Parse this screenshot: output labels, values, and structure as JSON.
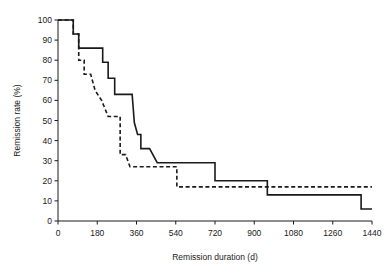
{
  "chart_data": {
    "type": "line",
    "title": "",
    "xlabel": "Remission duration (d)",
    "ylabel": "Remission rate (%)",
    "xlim": [
      0,
      1440
    ],
    "ylim": [
      0,
      100
    ],
    "xticks": [
      0,
      180,
      360,
      540,
      720,
      900,
      1080,
      1260,
      1440
    ],
    "yticks": [
      0,
      10,
      20,
      30,
      40,
      50,
      60,
      70,
      80,
      90,
      100
    ],
    "xtick_labels": [
      "0",
      "180",
      "360",
      "540",
      "720",
      "900",
      "1080",
      "1260",
      "1440"
    ],
    "ytick_labels": [
      "0",
      "10",
      "20",
      "30",
      "40",
      "50",
      "60",
      "70",
      "80",
      "90",
      "100"
    ],
    "grid": false,
    "legend": "none",
    "step_style": "post",
    "series": [
      {
        "name": "solid-curve",
        "style": "solid",
        "color": "#1a1a1a",
        "x": [
          0,
          70,
          70,
          95,
          95,
          120,
          205,
          205,
          230,
          230,
          260,
          260,
          340,
          340,
          350,
          350,
          365,
          365,
          380,
          380,
          420,
          420,
          455,
          455,
          540,
          540,
          720,
          720,
          960,
          960,
          1390,
          1390,
          1440
        ],
        "y": [
          100,
          100,
          93,
          93,
          86,
          86,
          86,
          79,
          79,
          71,
          71,
          63,
          63,
          63,
          49,
          49,
          43,
          43,
          43,
          36,
          36,
          36,
          29,
          29,
          29,
          29,
          29,
          20,
          20,
          13,
          13,
          6,
          6
        ]
      },
      {
        "name": "dashed-curve",
        "style": "dashed",
        "color": "#1a1a1a",
        "x": [
          0,
          70,
          70,
          95,
          95,
          120,
          120,
          150,
          150,
          170,
          170,
          200,
          200,
          230,
          230,
          285,
          285,
          310,
          310,
          330,
          330,
          545,
          545,
          960,
          960,
          1440
        ],
        "y": [
          100,
          100,
          93,
          93,
          80,
          80,
          73,
          73,
          73,
          65,
          65,
          60,
          60,
          52,
          52,
          52,
          33,
          33,
          33,
          27,
          27,
          27,
          17,
          17,
          17,
          17
        ]
      }
    ]
  },
  "figure": {
    "xaxis_title": "Remission duration (d)",
    "yaxis_title": "Remission rate (%)"
  }
}
